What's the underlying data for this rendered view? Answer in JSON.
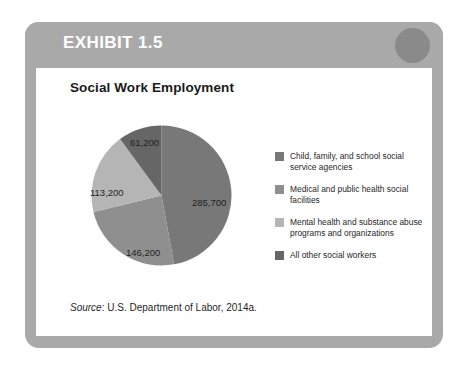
{
  "exhibit": {
    "header_label": "EXHIBIT 1.5",
    "header_bg": "#a9a9a9",
    "header_circle_color": "#8a8a8a",
    "frame_color": "#a9a9a9",
    "card_bg": "#ffffff"
  },
  "source": {
    "prefix": "Source",
    "separator": ":",
    "text": "U.S. Department of Labor, 2014a."
  },
  "chart_data": {
    "type": "pie",
    "title": "Social Work Employment",
    "xlabel": "",
    "ylabel": "",
    "total": 606300,
    "start_angle_deg": 0,
    "direction": "clockwise",
    "legend_position": "right",
    "grid": false,
    "categories": [
      "Child, family, and school social service agencies",
      "Medical and public health social facilities",
      "Mental health and substance abuse programs and organizations",
      "All other social workers"
    ],
    "values": [
      285700,
      146200,
      113200,
      61200
    ],
    "data_labels": [
      "285,700",
      "146,200",
      "113,200",
      "61,200"
    ],
    "colors": [
      "#787878",
      "#8f8f8f",
      "#b5b5b5",
      "#666666"
    ],
    "slices": [
      {
        "label": "Child, family, and school social service agencies",
        "value": 285700,
        "data_label": "285,700",
        "color": "#787878",
        "angle_deg": 169.6,
        "percent": 47.1,
        "label_x": 101,
        "label_y": 72
      },
      {
        "label": "Medical and public health social facilities",
        "value": 146200,
        "data_label": "146,200",
        "color": "#8f8f8f",
        "angle_deg": 86.8,
        "percent": 24.1,
        "label_x": 35,
        "label_y": 122
      },
      {
        "label": "Mental health and substance abuse programs and organizations",
        "value": 113200,
        "data_label": "113,200",
        "color": "#b5b5b5",
        "angle_deg": 67.2,
        "percent": 18.7,
        "label_x": -1,
        "label_y": 62
      },
      {
        "label": "All other social workers",
        "value": 61200,
        "data_label": "61,200",
        "color": "#666666",
        "angle_deg": 36.3,
        "percent": 10.1,
        "label_x": 39,
        "label_y": 12
      }
    ],
    "legend": [
      {
        "color": "#787878",
        "line1": "Child, family, and school social",
        "line2": "service agencies"
      },
      {
        "color": "#8f8f8f",
        "line1": "Medical and public health social",
        "line2": "facilities"
      },
      {
        "color": "#b5b5b5",
        "line1": "Mental health and substance abuse",
        "line2": "programs and organizations"
      },
      {
        "color": "#666666",
        "line1": "All other social workers",
        "line2": ""
      }
    ]
  }
}
